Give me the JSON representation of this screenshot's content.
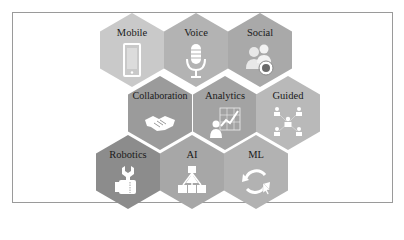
{
  "diagram": {
    "type": "hexagon-grid",
    "hexagons": [
      {
        "label": "Mobile",
        "icon": "mobile-phone-icon",
        "color": "#c9c9c9"
      },
      {
        "label": "Voice",
        "icon": "microphone-icon",
        "color": "#b3b3b3"
      },
      {
        "label": "Social",
        "icon": "social-users-icon",
        "color": "#a9a9a9"
      },
      {
        "label": "Collaboration",
        "icon": "handshake-icon",
        "color": "#9b9b9b"
      },
      {
        "label": "Analytics",
        "icon": "analytics-chart-icon",
        "color": "#a3a3a3"
      },
      {
        "label": "Guided",
        "icon": "network-people-icon",
        "color": "#b9b9b9"
      },
      {
        "label": "Robotics",
        "icon": "wrench-hand-icon",
        "color": "#8c8c8c"
      },
      {
        "label": "AI",
        "icon": "hierarchy-icon",
        "color": "#a7a7a7"
      },
      {
        "label": "ML",
        "icon": "cycle-arrows-icon",
        "color": "#b2b2b2"
      }
    ]
  }
}
